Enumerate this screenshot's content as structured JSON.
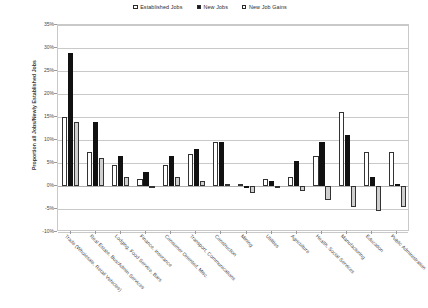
{
  "chart_data": {
    "type": "bar",
    "title": "",
    "xlabel": "",
    "ylabel": "Proportion all Jobs/Newly Established Jobs",
    "ylim": [
      -10,
      35
    ],
    "ytick_labels": [
      "35%",
      "30%",
      "25%",
      "20%",
      "15%",
      "10%",
      "5%",
      "0%",
      "-5%",
      "-10%"
    ],
    "ytick_values": [
      35,
      30,
      25,
      20,
      15,
      10,
      5,
      0,
      -5,
      -10
    ],
    "grid": true,
    "legend_position": "top-center",
    "categories": [
      "Trade (Wholesale, Retail Vehicles)",
      "Real Estate, Bus/Admin Services",
      "Lodging, Food Service, Bars",
      "Finance, Insurance",
      "Consumer Oriented, Misc.",
      "Transport, Communications",
      "Construction",
      "Mining",
      "Utilities",
      "Agriculture",
      "Health, Social Services",
      "Manufacturing",
      "Education",
      "Public Administration"
    ],
    "series": [
      {
        "name": "Established Jobs",
        "color": "#ffffff",
        "values": [
          15.0,
          7.5,
          4.5,
          1.5,
          4.5,
          7.0,
          9.5,
          0.5,
          1.5,
          2.0,
          6.5,
          16.0,
          7.5,
          7.5
        ]
      },
      {
        "name": "New Jobs",
        "color": "#111111",
        "values": [
          29.0,
          14.0,
          6.5,
          3.0,
          6.5,
          8.0,
          9.5,
          -0.5,
          1.0,
          5.5,
          9.5,
          11.0,
          2.0,
          0.5
        ]
      },
      {
        "name": "New Job Gains",
        "color": "#cfcfcf",
        "values": [
          14.0,
          6.0,
          2.0,
          0.0,
          2.0,
          1.0,
          0.5,
          -1.5,
          -0.5,
          -1.0,
          -3.0,
          -4.5,
          -5.5,
          -4.5
        ]
      }
    ]
  },
  "legend": {
    "items": [
      {
        "label": "Established Jobs",
        "swatch": "open-square-white"
      },
      {
        "label": "New Jobs",
        "swatch": "filled-square-black"
      },
      {
        "label": "New Job Gains",
        "swatch": "open-square-gray"
      }
    ]
  }
}
